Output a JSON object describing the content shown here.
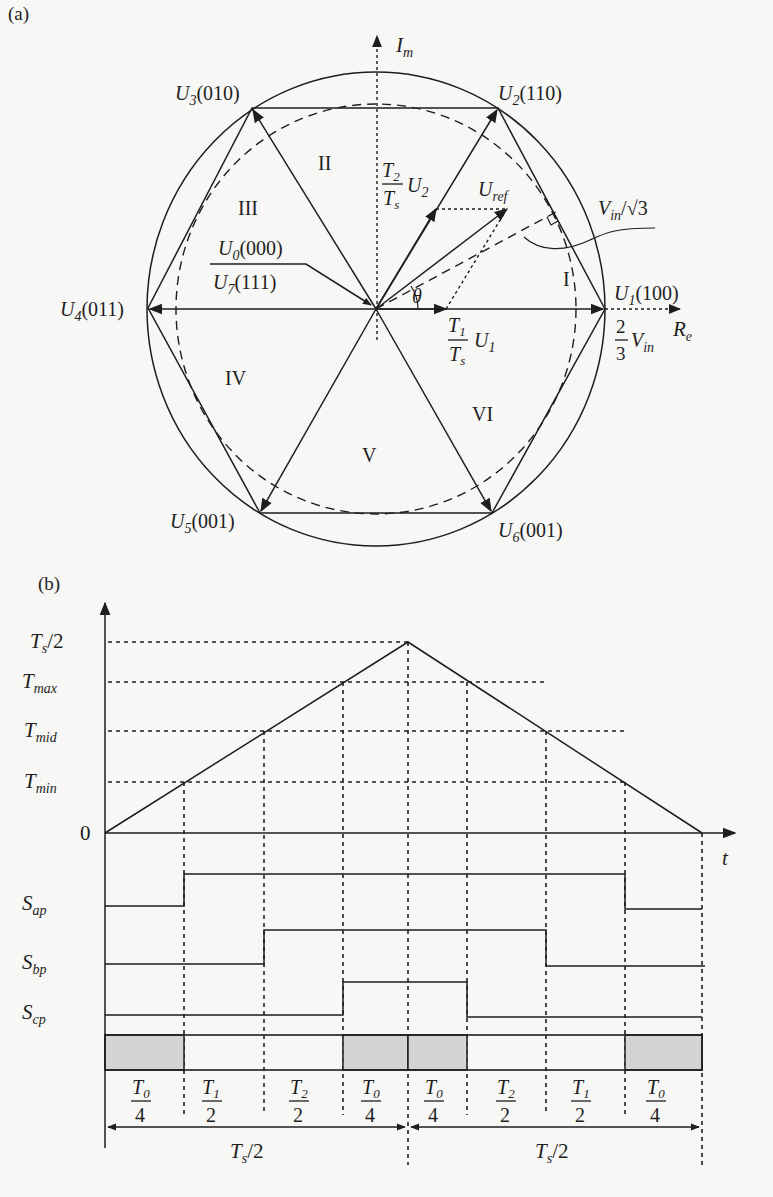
{
  "figure": {
    "panel_a": {
      "label": "(a)",
      "axes": {
        "imag_label": "I",
        "imag_sub": "m",
        "real_label": "R",
        "real_sub": "e"
      },
      "vectors": [
        {
          "name": "U",
          "sub": "1",
          "code": "(100)"
        },
        {
          "name": "U",
          "sub": "2",
          "code": "(110)"
        },
        {
          "name": "U",
          "sub": "3",
          "code": "(010)"
        },
        {
          "name": "U",
          "sub": "4",
          "code": "(011)"
        },
        {
          "name": "U",
          "sub": "5",
          "code": "(001)"
        },
        {
          "name": "U",
          "sub": "6",
          "code": "(001)"
        }
      ],
      "zero_vectors": {
        "top": {
          "name": "U",
          "sub": "0",
          "code": "(000)"
        },
        "bottom": {
          "name": "U",
          "sub": "7",
          "code": "(111)"
        }
      },
      "sectors": [
        "I",
        "II",
        "III",
        "IV",
        "V",
        "VI"
      ],
      "reference": {
        "name": "U",
        "sub": "ref"
      },
      "angle": "θ",
      "t2_component": {
        "num": "T",
        "num_sub": "2",
        "den": "T",
        "den_sub": "s",
        "vec": "U",
        "vec_sub": "2"
      },
      "t1_component": {
        "num": "T",
        "num_sub": "1",
        "den": "T",
        "den_sub": "s",
        "vec": "U",
        "vec_sub": "1"
      },
      "magnitude": {
        "num": "2",
        "den": "3",
        "var": "V",
        "var_sub": "in"
      },
      "inscribed_radius": {
        "var": "V",
        "var_sub": "in",
        "div": "/√3"
      }
    },
    "panel_b": {
      "label": "(b)",
      "y_ticks": [
        {
          "main": "T",
          "sub": "s",
          "rest": "/2"
        },
        {
          "main": "T",
          "sub": "max",
          "rest": ""
        },
        {
          "main": "T",
          "sub": "mid",
          "rest": ""
        },
        {
          "main": "T",
          "sub": "min",
          "rest": ""
        },
        {
          "main": "0",
          "sub": "",
          "rest": ""
        }
      ],
      "x_axis_label": "t",
      "signals": [
        {
          "main": "S",
          "sub": "ap"
        },
        {
          "main": "S",
          "sub": "bp"
        },
        {
          "main": "S",
          "sub": "cp"
        }
      ],
      "intervals": [
        {
          "num": "T",
          "num_sub": "0",
          "den": "4"
        },
        {
          "num": "T",
          "num_sub": "1",
          "den": "2"
        },
        {
          "num": "T",
          "num_sub": "2",
          "den": "2"
        },
        {
          "num": "T",
          "num_sub": "0",
          "den": "4"
        },
        {
          "num": "T",
          "num_sub": "0",
          "den": "4"
        },
        {
          "num": "T",
          "num_sub": "2",
          "den": "2"
        },
        {
          "num": "T",
          "num_sub": "1",
          "den": "2"
        },
        {
          "num": "T",
          "num_sub": "0",
          "den": "4"
        }
      ],
      "half_periods": [
        {
          "main": "T",
          "sub": "s",
          "rest": "/2"
        },
        {
          "main": "T",
          "sub": "s",
          "rest": "/2"
        }
      ]
    }
  }
}
